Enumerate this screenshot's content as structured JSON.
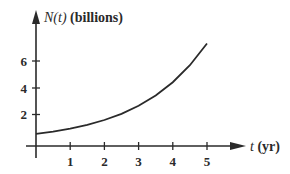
{
  "chart_data": {
    "type": "line",
    "title": "",
    "xlabel": "t (yr)",
    "ylabel": "N(t) (billions)",
    "xlabel_var": "t",
    "xlabel_unit": "(yr)",
    "ylabel_var": "N(t)",
    "ylabel_unit": "(billions)",
    "x_ticks": [
      "1",
      "2",
      "3",
      "4",
      "5"
    ],
    "y_ticks": [
      "2",
      "4",
      "6"
    ],
    "xlim": [
      0,
      5.9
    ],
    "ylim": [
      0,
      8.5
    ],
    "grid": false,
    "legend": "none",
    "series": [
      {
        "name": "N(t)",
        "x": [
          0,
          0.5,
          1,
          1.5,
          2,
          2.5,
          3,
          3.5,
          4,
          4.5,
          5
        ],
        "values": [
          0.6,
          0.77,
          0.99,
          1.27,
          1.63,
          2.09,
          2.69,
          3.45,
          4.43,
          5.69,
          7.3
        ]
      }
    ]
  }
}
